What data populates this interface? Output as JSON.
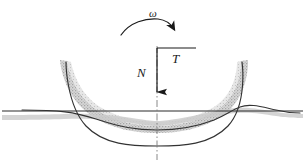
{
  "figure": {
    "type": "engineering-free-body-diagram",
    "background_color": "#ffffff",
    "width": 305,
    "height": 162,
    "labels": {
      "angular_velocity": "ω",
      "normal_force": "N",
      "tangential_force": "T"
    },
    "colors": {
      "ink": "#1a1a1a",
      "curve": "#3a3a3a",
      "band_light": "#d6d6d6",
      "band_mid": "#bcbcbc",
      "band_dark": "#9a9a9a",
      "surface_line": "#2b2b2b",
      "centerline": "#6e6e6e"
    },
    "elements": {
      "rotation_arrow": {
        "name": "angular-velocity-arc-arrow",
        "direction": "clockwise",
        "start_x": 121,
        "start_y": 34,
        "end_x": 176,
        "end_y": 31,
        "apex_y": 19
      },
      "load_arrow": {
        "name": "normal-force-arrow",
        "direction": "down",
        "x": 157,
        "top_y": 48,
        "tip_y": 100
      },
      "torque_bracket": {
        "name": "tangential-force-bracket",
        "x1": 157,
        "x2": 196,
        "y": 48
      },
      "ground_line": {
        "name": "undeformed-surface-line",
        "x1": 2,
        "x2": 303,
        "y": 111
      },
      "centerline": {
        "name": "axis-of-rotation-centerline",
        "x": 157,
        "y1": 46,
        "y2": 160,
        "style": "dash-dot"
      },
      "shaded_band": {
        "name": "deformed-bowl-band",
        "left_top_x": 60,
        "right_top_x": 248,
        "top_y": 60,
        "bottom_y": 127
      },
      "solid_bowl_curve": {
        "name": "bowl-profile-curve",
        "left_top_x": 66,
        "right_top_x": 242,
        "top_y": 62,
        "bottom_y": 145
      }
    }
  }
}
